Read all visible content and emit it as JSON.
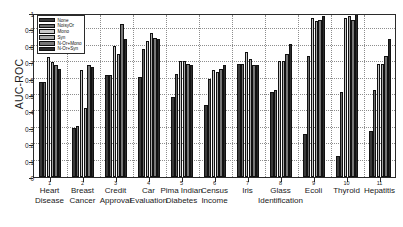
{
  "chart_data": {
    "type": "bar",
    "title": "",
    "xlabel": "",
    "ylabel": "AUC-ROC",
    "ylim": [
      0,
      1
    ],
    "ytick_labels": [
      "0",
      "0.1",
      "0.2",
      "0.3",
      "0.4",
      "0.5",
      "0.6",
      "0.7",
      "0.8",
      "0.9",
      "1"
    ],
    "ytick_values": [
      0,
      0.1,
      0.2,
      0.3,
      0.4,
      0.5,
      0.6,
      0.7,
      0.8,
      0.9,
      1
    ],
    "grid": true,
    "legend_position": "upper left",
    "categories": [
      "Heart\nDisease",
      "Breast\nCancer",
      "Credit\nApproval",
      "Car\nEvaluation",
      "Pima Indian\nDiabetes",
      "Census\nIncome",
      "Iris",
      "Glass\nIdentification",
      "Ecoli",
      "Thyroid",
      "Hepatitis"
    ],
    "xtick_numbers": [
      "1",
      "2",
      "3",
      "4",
      "5",
      "6",
      "7",
      "8",
      "9",
      "10",
      "11"
    ],
    "series": [
      {
        "name": "None",
        "color": "#3a3a3a",
        "values": [
          0.58,
          0.3,
          0.62,
          0.61,
          0.49,
          0.44,
          0.69,
          0.52,
          0.26,
          0.13,
          0.28
        ]
      },
      {
        "name": "NoisyOr",
        "color": "#6e6e6e",
        "values": [
          0.58,
          0.31,
          0.62,
          0.78,
          0.63,
          0.6,
          0.69,
          0.53,
          0.74,
          0.52,
          0.53
        ]
      },
      {
        "name": "Mono",
        "color": "#c8c8c8",
        "values": [
          0.73,
          0.65,
          0.8,
          0.83,
          0.71,
          0.65,
          0.76,
          0.71,
          0.97,
          0.97,
          0.69
        ]
      },
      {
        "name": "Syn",
        "color": "#a8a8a8",
        "values": [
          0.7,
          0.42,
          0.75,
          0.88,
          0.71,
          0.64,
          0.72,
          0.71,
          0.95,
          0.98,
          0.69
        ]
      },
      {
        "name": "N-Or+Mono",
        "color": "#777777",
        "values": [
          0.68,
          0.68,
          0.93,
          0.85,
          0.69,
          0.66,
          0.68,
          0.75,
          0.96,
          0.96,
          0.74
        ]
      },
      {
        "name": "N-Or+Syn",
        "color": "#2a2a2a",
        "values": [
          0.66,
          0.67,
          0.84,
          0.84,
          0.68,
          0.68,
          0.68,
          0.81,
          0.98,
          1.0,
          0.84
        ]
      }
    ]
  }
}
